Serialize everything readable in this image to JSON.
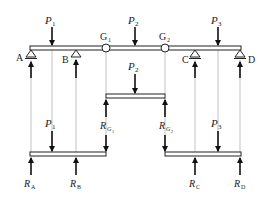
{
  "diagram": {
    "type": "gerber-beam-decomposition",
    "top_beam": {
      "supports": [
        {
          "id": "A",
          "label": "A",
          "x": 31
        },
        {
          "id": "B",
          "label": "B",
          "x": 76
        },
        {
          "id": "C",
          "label": "C",
          "x": 195
        },
        {
          "id": "D",
          "label": "D",
          "x": 240
        }
      ],
      "hinges": [
        {
          "id": "G1",
          "label": "G",
          "sub": "1",
          "x": 106
        },
        {
          "id": "G2",
          "label": "G",
          "sub": "2",
          "x": 165
        }
      ],
      "loads": [
        {
          "id": "P1",
          "label": "P",
          "sub": "1",
          "x": 52
        },
        {
          "id": "P2",
          "label": "P",
          "sub": "2",
          "x": 135
        },
        {
          "id": "P3",
          "label": "P",
          "sub": "3",
          "x": 218
        }
      ]
    },
    "middle_beam": {
      "load": {
        "label": "P",
        "sub": "2"
      },
      "reactions": [
        {
          "label": "R",
          "sub": "G",
          "subsub": "1"
        },
        {
          "label": "R",
          "sub": "G",
          "subsub": "2"
        }
      ]
    },
    "left_beam": {
      "load": {
        "label": "P",
        "sub": "1"
      },
      "hinge_load": {
        "label": "R",
        "sub": "G",
        "subsub": "1"
      },
      "reactions": [
        {
          "label": "R",
          "sub": "A"
        },
        {
          "label": "R",
          "sub": "B"
        }
      ]
    },
    "right_beam": {
      "load": {
        "label": "P",
        "sub": "3"
      },
      "hinge_load": {
        "label": "R",
        "sub": "G",
        "subsub": "2"
      },
      "reactions": [
        {
          "label": "R",
          "sub": "C"
        },
        {
          "label": "R",
          "sub": "D"
        }
      ]
    }
  },
  "labels": {
    "A": "A",
    "B": "B",
    "C": "C",
    "D": "D",
    "G": "G",
    "one": "1",
    "two": "2",
    "three": "3",
    "P": "P",
    "R": "R",
    "subA": "A",
    "subB": "B",
    "subC": "C",
    "subD": "D",
    "subG": "G"
  }
}
